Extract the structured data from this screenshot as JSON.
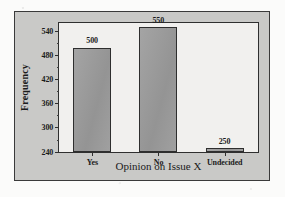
{
  "chart_data": {
    "type": "bar",
    "title": "",
    "categories": [
      "Yes",
      "No",
      "Undecided"
    ],
    "values": [
      500,
      550,
      250
    ],
    "data_labels": [
      "500",
      "550",
      "250"
    ],
    "xlabel": "Opinion on Issue X",
    "ylabel": "Frequency",
    "ylim": [
      240,
      560
    ],
    "ytick_values": [
      240,
      300,
      360,
      420,
      480,
      540
    ],
    "ytick_labels": [
      "240",
      "300",
      "360",
      "420",
      "480",
      "540"
    ],
    "ytick_minor_step": 30,
    "grid": false,
    "legend": false,
    "bar_color": "#9a9a9a",
    "bar_edge_color": "#2e2e2e",
    "plot_background": "#f1f0ee",
    "figure_background": "#c9c9c7",
    "axis_color": "#2f2f2f",
    "text_color": "#1b1b1b"
  }
}
